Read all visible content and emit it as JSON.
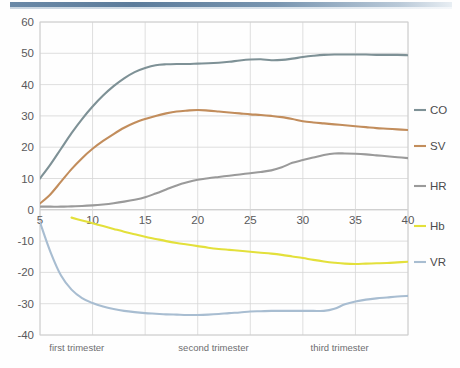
{
  "decor": {
    "topbar_color": "#5c7c9b",
    "topbar_name": "top-accent-bar"
  },
  "chart_data": {
    "type": "line",
    "title": "",
    "subtitle": "",
    "xlabel": "",
    "ylabel": "",
    "xlim": [
      5,
      40
    ],
    "ylim": [
      -40,
      60
    ],
    "grid": true,
    "legend_position": "right",
    "x_ticks": [
      "5",
      "10",
      "15",
      "20",
      "25",
      "30",
      "35",
      "40"
    ],
    "x_tick_values": [
      5,
      10,
      15,
      20,
      25,
      30,
      35,
      40
    ],
    "y_ticks": [
      "60",
      "50",
      "40",
      "30",
      "20",
      "10",
      "0",
      "-10",
      "-20",
      "-30",
      "-40"
    ],
    "y_tick_values": [
      60,
      50,
      40,
      30,
      20,
      10,
      0,
      -10,
      -20,
      -30,
      -40
    ],
    "x": [
      5,
      6,
      7,
      8,
      9,
      10,
      11,
      12,
      13,
      14,
      15,
      16,
      17,
      18,
      19,
      20,
      21,
      22,
      23,
      24,
      25,
      26,
      27,
      28,
      29,
      30,
      31,
      32,
      33,
      34,
      35,
      36,
      37,
      38,
      39,
      40
    ],
    "series": [
      {
        "name": "CO",
        "color": "#7e9196",
        "values": [
          10.0,
          14.5,
          19.5,
          24.5,
          29.0,
          33.0,
          36.5,
          39.5,
          42.0,
          44.0,
          45.3,
          46.2,
          46.5,
          46.6,
          46.6,
          46.7,
          46.8,
          47.0,
          47.3,
          47.7,
          48.0,
          48.1,
          47.8,
          47.9,
          48.3,
          48.8,
          49.2,
          49.5,
          49.6,
          49.6,
          49.6,
          49.6,
          49.5,
          49.5,
          49.5,
          49.4
        ]
      },
      {
        "name": "SV",
        "color": "#c28d5c",
        "values": [
          2.0,
          5.0,
          9.0,
          13.0,
          16.5,
          19.5,
          22.0,
          24.2,
          26.2,
          27.8,
          29.0,
          30.0,
          30.8,
          31.4,
          31.7,
          31.9,
          31.7,
          31.4,
          31.1,
          30.8,
          30.5,
          30.3,
          30.0,
          29.6,
          29.0,
          28.3,
          27.9,
          27.6,
          27.3,
          27.0,
          26.7,
          26.4,
          26.1,
          25.9,
          25.7,
          25.5
        ]
      },
      {
        "name": "HR",
        "color": "#9a9a9a",
        "values": [
          1.0,
          1.0,
          1.0,
          1.1,
          1.2,
          1.4,
          1.7,
          2.1,
          2.6,
          3.2,
          4.0,
          5.2,
          6.5,
          7.8,
          8.8,
          9.6,
          10.1,
          10.5,
          10.9,
          11.3,
          11.7,
          12.1,
          12.6,
          13.6,
          15.0,
          15.9,
          16.7,
          17.5,
          18.0,
          18.0,
          17.9,
          17.7,
          17.4,
          17.1,
          16.8,
          16.5
        ]
      },
      {
        "name": "Hb",
        "color": "#e3e03b",
        "values": [
          null,
          null,
          null,
          -2.5,
          -3.4,
          -4.3,
          -5.2,
          -6.1,
          -7.0,
          -7.8,
          -8.6,
          -9.3,
          -10.0,
          -10.6,
          -11.1,
          -11.6,
          -12.1,
          -12.5,
          -12.8,
          -13.1,
          -13.4,
          -13.7,
          -14.0,
          -14.4,
          -14.9,
          -15.4,
          -16.0,
          -16.5,
          -16.9,
          -17.2,
          -17.3,
          -17.2,
          -17.1,
          -17.0,
          -16.8,
          -16.6
        ]
      },
      {
        "name": "VR",
        "color": "#a8bdd1",
        "values": [
          -4.0,
          -13.5,
          -21.0,
          -25.5,
          -28.2,
          -29.8,
          -30.9,
          -31.7,
          -32.3,
          -32.7,
          -33.0,
          -33.2,
          -33.4,
          -33.5,
          -33.6,
          -33.6,
          -33.5,
          -33.3,
          -33.0,
          -32.8,
          -32.5,
          -32.4,
          -32.3,
          -32.3,
          -32.3,
          -32.3,
          -32.3,
          -32.3,
          -31.6,
          -30.2,
          -29.3,
          -28.7,
          -28.3,
          -28.0,
          -27.7,
          -27.5
        ]
      }
    ],
    "legend": [
      {
        "label": "CO",
        "color": "#7e9196"
      },
      {
        "label": "SV",
        "color": "#c28d5c"
      },
      {
        "label": "HR",
        "color": "#9a9a9a"
      },
      {
        "label": "Hb",
        "color": "#e3e03b"
      },
      {
        "label": "VR",
        "color": "#a8bdd1"
      }
    ],
    "annotations": [
      {
        "text": "first trimester",
        "x": 8.5
      },
      {
        "text": "second trimester",
        "x": 21.5
      },
      {
        "text": "third trimester",
        "x": 33.5
      }
    ]
  }
}
